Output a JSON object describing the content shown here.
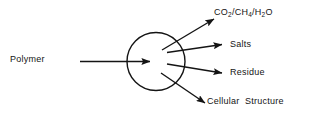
{
  "diagram": {
    "type": "flow-diagram",
    "background_color": "#ffffff",
    "stroke_color": "#141414",
    "text_color": "#141414",
    "input": {
      "label": "Polymer",
      "arrow": "input-arrow-to-process"
    },
    "process": {
      "shape": "circle",
      "label": ""
    },
    "outputs": [
      {
        "id": "gases",
        "label_parts": [
          {
            "text": "CO",
            "sub": "2"
          },
          {
            "text": "/CH",
            "sub": "4"
          },
          {
            "text": "/H",
            "sub": "2"
          },
          {
            "text": "O",
            "sub": ""
          }
        ],
        "label_plain": "CO2/CH4/H2O",
        "direction": "up-right"
      },
      {
        "id": "salts",
        "label_plain": "Salts",
        "direction": "right-slightly-up"
      },
      {
        "id": "residue",
        "label_plain": "Residue",
        "direction": "right-slightly-down"
      },
      {
        "id": "cellular-structure",
        "label_plain": "Cellular  Structure",
        "direction": "down-right"
      }
    ]
  }
}
